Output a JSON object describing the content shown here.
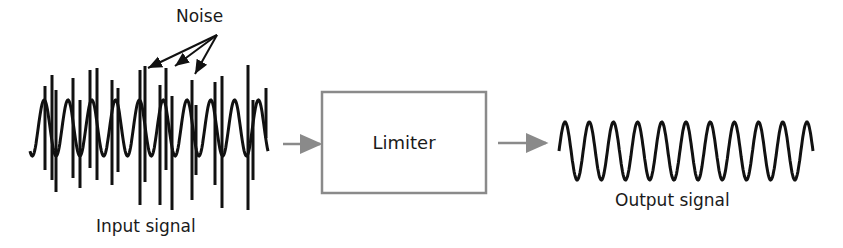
{
  "diagram": {
    "noise_label": "Noise",
    "input_label": "Input signal",
    "block_label": "Limiter",
    "output_label": "Output signal",
    "colors": {
      "line": "#111111",
      "arrow": "#8a8a8a",
      "box": "#8a8a8a"
    },
    "input_wave": {
      "x_start": 30,
      "x_end": 268,
      "cycles": 10,
      "center_y": 128,
      "amplitude": 28
    },
    "output_wave": {
      "x_start": 559,
      "x_end": 813,
      "cycles": 10.5,
      "center_y": 151,
      "amplitude": 29
    }
  }
}
